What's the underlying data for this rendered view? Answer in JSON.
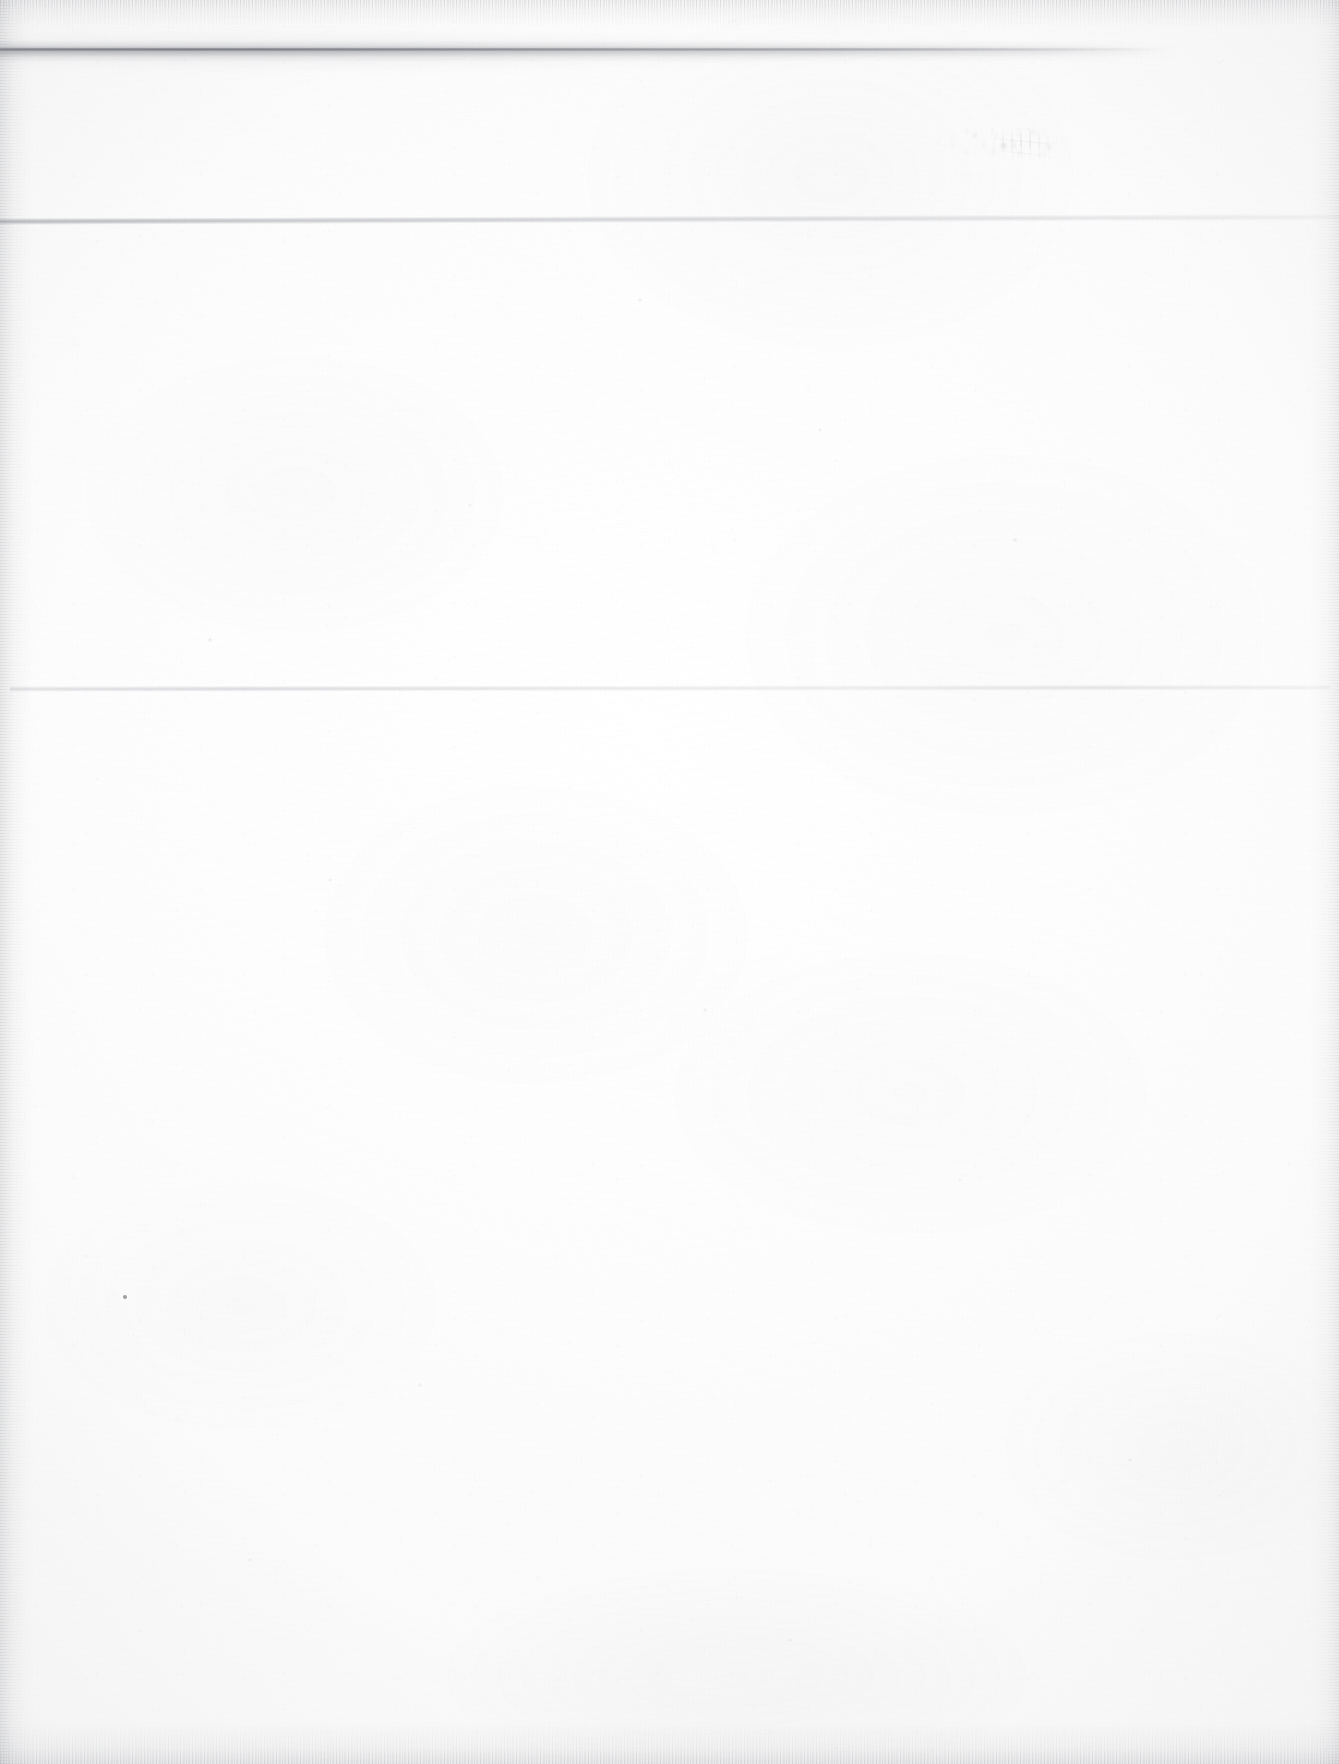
{
  "document": {
    "type": "scanned-page",
    "page_state": "blank",
    "visible_text": "",
    "caption": ""
  },
  "page": {
    "width_px": 1339,
    "height_px": 1764,
    "background_color": "#fdfdfd",
    "paper_tone": "#fafafa"
  },
  "artifacts": {
    "top_smudge_band": {
      "name": "top-smudge-band",
      "description": "horizontal grey smudge near top edge",
      "x_px": 0,
      "y_px": 45,
      "width_px": 1175,
      "height_px": 14,
      "color": "#6c6e78"
    },
    "rule_upper": {
      "name": "upper-hairline-rule",
      "description": "faint thin horizontal rule",
      "x_px": 0,
      "y_px": 222,
      "width_px": 1339,
      "color": "#9092a0"
    },
    "rule_lower": {
      "name": "lower-hairline-rule",
      "description": "very faint thin horizontal rule",
      "x_px": 10,
      "y_px": 689,
      "width_px": 1320,
      "color": "#aaacb6"
    },
    "ghost_marks": {
      "name": "ghost-bleedthrough-marks",
      "description": "illegible faded marks in upper right quadrant",
      "x_px": 900,
      "y_px": 118,
      "width_px": 170,
      "height_px": 48,
      "color": "#94969e"
    },
    "ink_speck": {
      "name": "ink-speck",
      "description": "isolated dark dot in lower left area",
      "x_px": 125,
      "y_px": 1297,
      "diameter_px": 4,
      "color": "#60626a"
    },
    "edge_noise": {
      "name": "scan-edge-noise",
      "description": "speckled darkening along page borders",
      "color": "#787a82"
    }
  }
}
